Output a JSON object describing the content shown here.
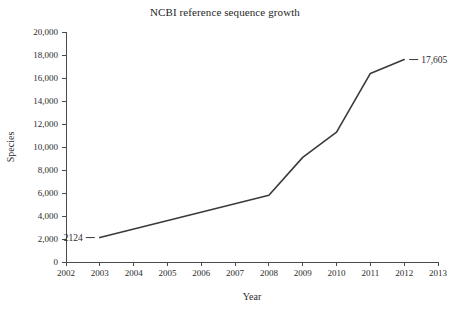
{
  "chart_data": {
    "type": "line",
    "title": "NCBI reference sequence growth",
    "xlabel": "Year",
    "ylabel": "Species",
    "xlim": [
      2002,
      2013
    ],
    "ylim": [
      0,
      20000
    ],
    "grid": false,
    "legend": false,
    "legend_position": "none",
    "line_color": "#3a3a3a",
    "x": [
      2003,
      2008,
      2009,
      2010,
      2011,
      2012
    ],
    "values": [
      2124,
      5800,
      9100,
      11300,
      16400,
      17605
    ],
    "series": [
      {
        "name": "Species",
        "x": [
          2003,
          2008,
          2009,
          2010,
          2011,
          2012
        ],
        "values": [
          2124,
          5800,
          9100,
          11300,
          16400,
          17605
        ]
      }
    ],
    "x_tick_labels": [
      "2002",
      "2003",
      "2004",
      "2005",
      "2006",
      "2007",
      "2008",
      "2009",
      "2010",
      "2011",
      "2012",
      "2013"
    ],
    "x_tick_values": [
      2002,
      2003,
      2004,
      2005,
      2006,
      2007,
      2008,
      2009,
      2010,
      2011,
      2012,
      2013
    ],
    "y_tick_labels": [
      "0",
      "2,000",
      "4,000",
      "6,000",
      "8,000",
      "10,000",
      "12,000",
      "14,000",
      "16,000",
      "18,000",
      "20,000"
    ],
    "y_tick_values": [
      0,
      2000,
      4000,
      6000,
      8000,
      10000,
      12000,
      14000,
      16000,
      18000,
      20000
    ],
    "annotations": [
      {
        "text": "2124",
        "x": 2003,
        "y": 2124,
        "position": "left"
      },
      {
        "text": "17,605",
        "x": 2012,
        "y": 17605,
        "position": "right"
      }
    ]
  }
}
